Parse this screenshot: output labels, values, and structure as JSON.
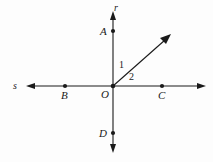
{
  "figure": {
    "background_color": "#fdfdfd",
    "stroke_color": "#1a1a1a",
    "width": 213,
    "height": 162,
    "lines": [
      {
        "name": "r",
        "label": "r",
        "orientation": "vertical",
        "double_arrow": true,
        "x1": 113,
        "y1": 12,
        "x2": 113,
        "y2": 152
      },
      {
        "name": "s",
        "label": "s",
        "orientation": "horizontal",
        "double_arrow": true,
        "x1": 27,
        "y1": 86,
        "x2": 205,
        "y2": 86
      }
    ],
    "ray": {
      "name": "ray-from-O",
      "from": "O",
      "single_arrow": true,
      "x1": 113,
      "y1": 86,
      "x2": 170,
      "y2": 35
    },
    "points": [
      {
        "id": "A",
        "label": "A",
        "x": 113,
        "y": 31
      },
      {
        "id": "B",
        "label": "B",
        "x": 65,
        "y": 86
      },
      {
        "id": "O",
        "label": "O",
        "x": 113,
        "y": 86
      },
      {
        "id": "C",
        "label": "C",
        "x": 162,
        "y": 86
      },
      {
        "id": "D",
        "label": "D",
        "x": 113,
        "y": 133
      }
    ],
    "angles": [
      {
        "id": "1",
        "label": "1",
        "between": "ray and line r (upward)"
      },
      {
        "id": "2",
        "label": "2",
        "between": "ray and line s (rightward)"
      }
    ]
  }
}
